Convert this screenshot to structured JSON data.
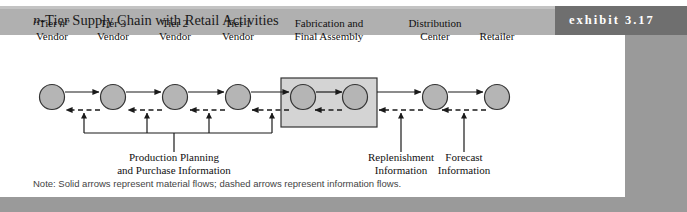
{
  "exhibit": {
    "tab_label": "exhibit 3.17",
    "title_prefix": "n",
    "title_rest": "-Tier Supply Chain with Retail Activities",
    "note": "Note: Solid arrows represent material flows; dashed arrows represent information flows."
  },
  "colors": {
    "header_band": "#b0b0b0",
    "shadow_plate": "#9a9a9a",
    "exhibit_tab": "#6f6f6f",
    "node_fill": "#b5b5b5",
    "node_stroke": "#333333",
    "box_fill": "#d4d4d4",
    "box_stroke": "#333333",
    "arrow": "#1a1a1a",
    "card": "#ffffff"
  },
  "nodes": [
    {
      "id": "tier-n-vendor",
      "line1_italic_n": true,
      "line1": "“Tier n”",
      "line1_pre": "“Tier ",
      "line1_ital": "n",
      "line1_post": "”",
      "line2": "Vendor",
      "cx": 52,
      "label_cx": 52
    },
    {
      "id": "tier-3-vendor",
      "line1": "Tier 3",
      "line2": "Vendor",
      "cx": 113,
      "label_cx": 113
    },
    {
      "id": "tier-2-vendor",
      "line1": "Tier 2",
      "line2": "Vendor",
      "cx": 175,
      "label_cx": 175
    },
    {
      "id": "tier-1-vendor",
      "line1": "Tier 1",
      "line2": "Vendor",
      "cx": 238,
      "label_cx": 238
    },
    {
      "id": "fabrication",
      "line1": "Fabrication and",
      "line2": "Final Assembly",
      "cx": 329,
      "label_cx": 329
    },
    {
      "id": "distribution",
      "line1": "Distribution",
      "line2": "Center",
      "cx": 435,
      "label_cx": 435
    },
    {
      "id": "retailer",
      "line1": "Retailer",
      "line2": "",
      "cx": 497,
      "label_cx": 497
    }
  ],
  "fabrication_box": {
    "inner_node_left_cx": 303,
    "inner_node_right_cx": 355
  },
  "info_labels": [
    {
      "id": "production-planning",
      "line1": "Production Planning",
      "line2": "and Purchase Information",
      "cx": 174
    },
    {
      "id": "replenishment",
      "line1": "Replenishment",
      "line2": "Information",
      "cx": 401
    },
    {
      "id": "forecast",
      "line1": "Forecast",
      "line2": "Information",
      "cx": 464
    }
  ],
  "flow_legend": {
    "solid": "material flows",
    "dashed": "information flows"
  }
}
